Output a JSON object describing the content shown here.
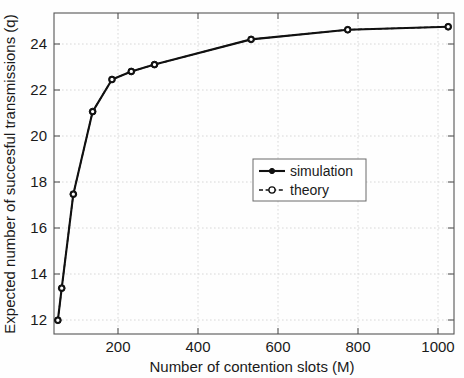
{
  "chart_data": {
    "type": "line",
    "title": "",
    "xlabel": "Number of contention slots (M)",
    "ylabel": "Expected number of succesful transmissions (q)",
    "xlim": [
      0,
      1035
    ],
    "ylim": [
      11.0,
      25.0
    ],
    "xticks": [
      200,
      400,
      600,
      800,
      1000
    ],
    "yticks": [
      12,
      14,
      16,
      18,
      20,
      22,
      24
    ],
    "xtick_labels": [
      "200",
      "400",
      "600",
      "800",
      "1000"
    ],
    "ytick_labels": [
      "12",
      "14",
      "16",
      "18",
      "20",
      "22",
      "24"
    ],
    "grid": true,
    "legend_position": "center-right",
    "x": [
      10,
      20,
      50,
      100,
      150,
      200,
      260,
      510,
      760,
      1020
    ],
    "series": [
      {
        "name": "simulation",
        "marker": "filled-circle",
        "linestyle": "solid",
        "color": "#111111",
        "values": [
          11.6,
          13.0,
          17.1,
          20.7,
          22.1,
          22.45,
          22.75,
          23.85,
          24.27,
          24.4
        ]
      },
      {
        "name": "theory",
        "marker": "open-circle",
        "linestyle": "dashed",
        "color": "#111111",
        "values": [
          11.6,
          13.0,
          17.1,
          20.7,
          22.1,
          22.45,
          22.75,
          23.85,
          24.27,
          24.4
        ]
      }
    ]
  },
  "legend": {
    "entries": [
      {
        "label": "simulation"
      },
      {
        "label": "theory"
      }
    ]
  },
  "axes": {
    "x_label": "Number of contention slots (M)",
    "y_label": "Expected number of succesful transmissions (q)",
    "x_tick_labels": [
      "200",
      "400",
      "600",
      "800",
      "1000"
    ],
    "y_tick_labels": [
      "12",
      "14",
      "16",
      "18",
      "20",
      "22",
      "24"
    ]
  }
}
